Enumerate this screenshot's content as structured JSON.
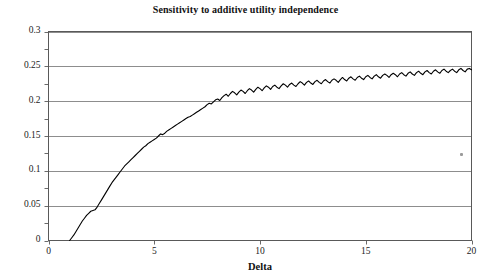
{
  "chart_data": {
    "type": "line",
    "title": "Sensitivity to additive utility independence",
    "xlabel": "Delta",
    "ylabel": "",
    "xlim": [
      0,
      20
    ],
    "ylim": [
      0,
      0.3
    ],
    "grid": true,
    "grid_axis": "y",
    "legend": null,
    "xticks": [
      0,
      5,
      10,
      15,
      20
    ],
    "xtick_labels": [
      "0",
      "5",
      "10",
      "15",
      "20"
    ],
    "yticks": [
      0,
      0.05,
      0.1,
      0.15,
      0.2,
      0.25,
      0.3
    ],
    "ytick_labels": [
      "0",
      "0.05",
      "0.1",
      "0.15",
      "0.2",
      "0.25",
      "0.3"
    ],
    "line_color": "#000000",
    "line_width": 1.1,
    "series": [
      {
        "name": "sensitivity",
        "x": [
          1.0,
          1.1,
          1.2,
          1.3,
          1.4,
          1.5,
          1.6,
          1.7,
          1.8,
          1.9,
          2.0,
          2.1,
          2.2,
          2.3,
          2.4,
          2.5,
          2.6,
          2.7,
          2.8,
          2.9,
          3.0,
          3.1,
          3.2,
          3.3,
          3.4,
          3.5,
          3.6,
          3.7,
          3.8,
          3.9,
          4.0,
          4.1,
          4.2,
          4.3,
          4.4,
          4.5,
          4.6,
          4.7,
          4.8,
          4.9,
          5.0,
          5.1,
          5.2,
          5.3,
          5.4,
          5.5,
          5.6,
          5.7,
          5.8,
          5.9,
          6.0,
          6.1,
          6.2,
          6.3,
          6.4,
          6.5,
          6.6,
          6.7,
          6.8,
          6.9,
          7.0,
          7.1,
          7.2,
          7.3,
          7.4,
          7.5,
          7.6,
          7.7,
          7.8,
          7.9,
          8.0,
          8.1,
          8.2,
          8.3,
          8.4,
          8.5,
          8.6,
          8.7,
          8.8,
          8.9,
          9.0,
          9.1,
          9.2,
          9.3,
          9.4,
          9.5,
          9.6,
          9.7,
          9.8,
          9.9,
          10.0,
          10.1,
          10.2,
          10.3,
          10.4,
          10.5,
          10.6,
          10.7,
          10.8,
          10.9,
          11.0,
          11.1,
          11.2,
          11.3,
          11.4,
          11.5,
          11.6,
          11.7,
          11.8,
          11.9,
          12.0,
          12.1,
          12.2,
          12.3,
          12.4,
          12.5,
          12.6,
          12.7,
          12.8,
          12.9,
          13.0,
          13.1,
          13.2,
          13.3,
          13.4,
          13.5,
          13.6,
          13.7,
          13.8,
          13.9,
          14.0,
          14.1,
          14.2,
          14.3,
          14.4,
          14.5,
          14.6,
          14.7,
          14.8,
          14.9,
          15.0,
          15.1,
          15.2,
          15.3,
          15.4,
          15.5,
          15.6,
          15.7,
          15.8,
          15.9,
          16.0,
          16.1,
          16.2,
          16.3,
          16.4,
          16.5,
          16.6,
          16.7,
          16.8,
          16.9,
          17.0,
          17.1,
          17.2,
          17.3,
          17.4,
          17.5,
          17.6,
          17.7,
          17.8,
          17.9,
          18.0,
          18.1,
          18.2,
          18.3,
          18.4,
          18.5,
          18.6,
          18.7,
          18.8,
          18.9,
          19.0,
          19.1,
          19.2,
          19.3,
          19.4,
          19.5,
          19.6,
          19.7,
          19.8,
          19.9,
          20.0
        ],
        "y": [
          0.0,
          0.004,
          0.008,
          0.013,
          0.018,
          0.023,
          0.028,
          0.032,
          0.036,
          0.039,
          0.042,
          0.043,
          0.044,
          0.048,
          0.053,
          0.058,
          0.063,
          0.068,
          0.073,
          0.078,
          0.083,
          0.087,
          0.091,
          0.095,
          0.099,
          0.103,
          0.107,
          0.11,
          0.113,
          0.116,
          0.119,
          0.122,
          0.125,
          0.128,
          0.131,
          0.134,
          0.136,
          0.139,
          0.141,
          0.143,
          0.145,
          0.147,
          0.15,
          0.153,
          0.152,
          0.154,
          0.157,
          0.159,
          0.161,
          0.163,
          0.165,
          0.167,
          0.169,
          0.171,
          0.173,
          0.175,
          0.177,
          0.178,
          0.18,
          0.182,
          0.184,
          0.186,
          0.188,
          0.19,
          0.192,
          0.195,
          0.197,
          0.196,
          0.199,
          0.202,
          0.203,
          0.201,
          0.205,
          0.208,
          0.21,
          0.207,
          0.211,
          0.214,
          0.212,
          0.209,
          0.213,
          0.216,
          0.214,
          0.211,
          0.215,
          0.218,
          0.216,
          0.213,
          0.217,
          0.22,
          0.218,
          0.215,
          0.219,
          0.222,
          0.22,
          0.217,
          0.221,
          0.223,
          0.22,
          0.218,
          0.222,
          0.225,
          0.223,
          0.22,
          0.224,
          0.226,
          0.223,
          0.221,
          0.225,
          0.228,
          0.226,
          0.223,
          0.227,
          0.229,
          0.226,
          0.224,
          0.228,
          0.23,
          0.227,
          0.225,
          0.229,
          0.231,
          0.228,
          0.226,
          0.23,
          0.232,
          0.23,
          0.227,
          0.231,
          0.234,
          0.231,
          0.229,
          0.233,
          0.235,
          0.232,
          0.23,
          0.234,
          0.236,
          0.233,
          0.231,
          0.235,
          0.237,
          0.234,
          0.232,
          0.236,
          0.238,
          0.235,
          0.233,
          0.237,
          0.239,
          0.237,
          0.234,
          0.238,
          0.24,
          0.238,
          0.235,
          0.239,
          0.241,
          0.238,
          0.236,
          0.24,
          0.242,
          0.239,
          0.237,
          0.241,
          0.243,
          0.24,
          0.238,
          0.242,
          0.244,
          0.241,
          0.239,
          0.243,
          0.245,
          0.242,
          0.24,
          0.244,
          0.246,
          0.243,
          0.241,
          0.244,
          0.246,
          0.243,
          0.241,
          0.245,
          0.247,
          0.244,
          0.242,
          0.246,
          0.247,
          0.245
        ]
      }
    ],
    "annotations": [
      {
        "name": "scan-speck",
        "x": 19.5,
        "y": 0.124
      }
    ]
  }
}
